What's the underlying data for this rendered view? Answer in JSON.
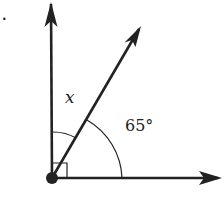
{
  "problem": {
    "marker": "."
  },
  "diagram": {
    "type": "angle-diagram",
    "vertex": {
      "x": 52,
      "y": 178
    },
    "rays": [
      {
        "name": "vertical-ray",
        "direction_deg": 90,
        "end": {
          "x": 51,
          "y": 2
        }
      },
      {
        "name": "diagonal-ray",
        "direction_deg": 63,
        "end": {
          "x": 141,
          "y": 26
        }
      },
      {
        "name": "horizontal-ray",
        "direction_deg": 0,
        "end": {
          "x": 222,
          "y": 178
        }
      }
    ],
    "right_angle_marker": true,
    "labels": {
      "unknown_angle": "x",
      "known_angle": "65°"
    },
    "known_angle_value": 65,
    "total_angle_value": 90,
    "colors": {
      "stroke": "#222222",
      "background": "#ffffff"
    }
  }
}
